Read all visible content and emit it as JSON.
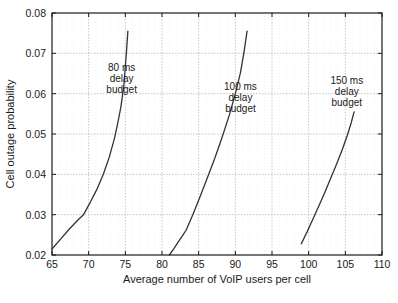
{
  "chart_data": {
    "type": "line",
    "title": "",
    "xlabel": "Average number of VoIP users per cell",
    "ylabel": "Cell outage probability",
    "xlim": [
      65,
      110
    ],
    "ylim": [
      0.02,
      0.08
    ],
    "xticks": [
      65,
      70,
      75,
      80,
      85,
      90,
      95,
      100,
      105,
      110
    ],
    "xtick_labels": [
      "65",
      "70",
      "75",
      "80",
      "85",
      "90",
      "95",
      "100",
      "105",
      "110"
    ],
    "yticks": [
      0.02,
      0.03,
      0.04,
      0.05,
      0.06,
      0.07,
      0.08
    ],
    "ytick_labels": [
      "0.02",
      "0.03",
      "0.04",
      "0.05",
      "0.06",
      "0.07",
      "0.08"
    ],
    "grid": true,
    "legend": "none",
    "line_color": "#333333",
    "grid_color": "#b8b8b8",
    "axis_color": "#1a1a1a",
    "series": [
      {
        "name": "80 ms delay budget",
        "x": [
          65.0,
          66.2,
          67.4,
          68.6,
          69.3,
          70.2,
          71.1,
          72.0,
          72.8,
          73.5,
          74.0,
          74.4,
          74.8,
          75.0,
          75.2,
          75.35
        ],
        "y": [
          0.0215,
          0.024,
          0.0265,
          0.0288,
          0.03,
          0.033,
          0.0362,
          0.04,
          0.0442,
          0.0488,
          0.053,
          0.0568,
          0.062,
          0.0668,
          0.0715,
          0.0755
        ]
      },
      {
        "name": "100 ms delay budget",
        "x": [
          81.0,
          81.6,
          82.2,
          82.8,
          83.3,
          84.2,
          85.2,
          86.2,
          87.2,
          88.2,
          89.2,
          90.0,
          90.7,
          91.2,
          91.6
        ],
        "y": [
          0.02,
          0.0215,
          0.0232,
          0.0248,
          0.0262,
          0.03,
          0.0345,
          0.0392,
          0.044,
          0.0492,
          0.0548,
          0.06,
          0.0652,
          0.0705,
          0.0755
        ]
      },
      {
        "name": "150 ms delay budget",
        "x": [
          99.0,
          99.8,
          100.6,
          101.4,
          102.2,
          103.0,
          103.8,
          104.6,
          105.3,
          105.8,
          106.2
        ],
        "y": [
          0.0228,
          0.0258,
          0.029,
          0.0322,
          0.0355,
          0.039,
          0.0425,
          0.0462,
          0.0498,
          0.0528,
          0.0555
        ]
      }
    ],
    "annotations": [
      {
        "id": "annotation-80ms",
        "lines": [
          "80 ms",
          "delay",
          "budget"
        ],
        "x": 74.5,
        "y": 0.0655
      },
      {
        "id": "annotation-100ms",
        "lines": [
          "100 ms",
          "delay",
          "budget"
        ],
        "x": 90.7,
        "y": 0.061
      },
      {
        "id": "annotation-150ms",
        "lines": [
          "150 ms",
          "delay",
          "budget"
        ],
        "x": 105.2,
        "y": 0.0625
      }
    ]
  }
}
